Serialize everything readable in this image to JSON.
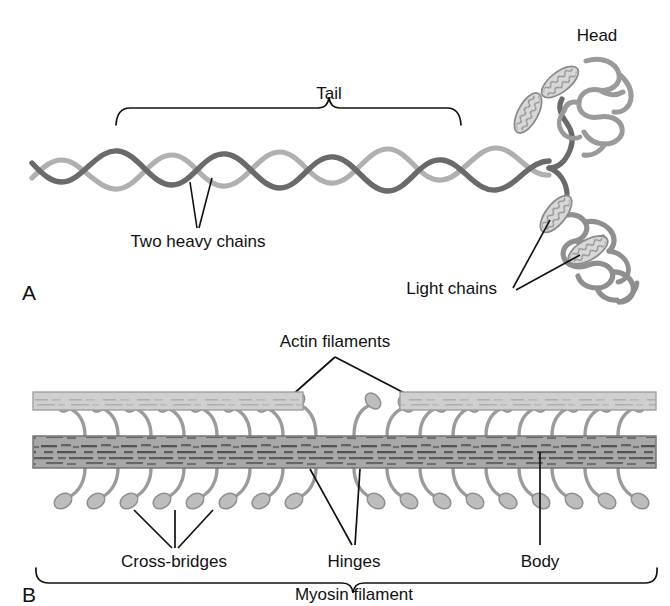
{
  "figure": {
    "background_color": "#ffffff",
    "width": 670,
    "height": 606
  },
  "colors": {
    "ink": "#111111",
    "heavy_chain_dark": "#6a6a6a",
    "heavy_chain_light": "#b0b0b0",
    "light_chain_fill": "#d8d8d8",
    "light_chain_stroke": "#8c8c8c",
    "actin_bar_fill": "#cfcfcf",
    "actin_bar_stroke": "#9a9a9a",
    "actin_bar_texture": "#a9a9a9",
    "myosin_body_fill": "#a8a8a8",
    "myosin_body_stroke": "#6f6f6f",
    "myosin_body_texture": "#4a4a4a",
    "crossbridge_stroke": "#9b9b9b",
    "crossbridge_head_fill": "#bdbdbd",
    "crossbridge_head_stroke": "#8e8e8e"
  },
  "panel_a": {
    "letter": "A",
    "labels": {
      "tail": "Tail",
      "head": "Head",
      "two_heavy_chains": "Two heavy chains",
      "light_chains": "Light chains"
    },
    "structure": {
      "tail_description": "coiled-coil of two intertwined helical heavy chains",
      "heavy_chain_count": 2,
      "light_chain_count": 4,
      "head_description": "two globular heads of tangled polypeptide coils"
    }
  },
  "panel_b": {
    "letter": "B",
    "labels": {
      "actin_filaments": "Actin filaments",
      "cross_bridges": "Cross-bridges",
      "hinges": "Hinges",
      "body": "Body",
      "myosin_filament": "Myosin filament"
    },
    "structure": {
      "actin_bar_count": 2,
      "myosin_body_bar_count": 1,
      "crossbridge_pairs_per_side": 9,
      "crossbridge_rows": 2,
      "center_bare_zone": true
    }
  }
}
